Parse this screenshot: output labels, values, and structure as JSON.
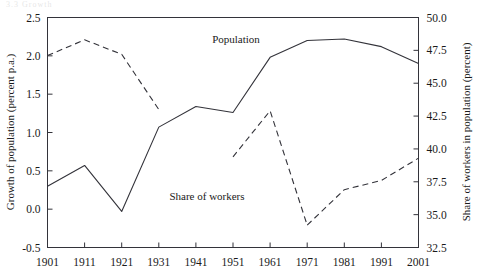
{
  "figure": {
    "ghost_text": "3.3  Growth",
    "background": "#ffffff",
    "line_color": "#33333a"
  },
  "chart_data": {
    "type": "line",
    "title": "",
    "xlabel": "",
    "ylabel": "Growth of population (percent p.a.)",
    "y2label": "Share of workers in population (percent)",
    "x": [
      1901,
      1911,
      1921,
      1931,
      1941,
      1951,
      1961,
      1971,
      1981,
      1991,
      2001
    ],
    "xticklabels": [
      "1901",
      "1911",
      "1921",
      "1931",
      "1941",
      "1951",
      "1961",
      "1971",
      "1981",
      "1991",
      "2001"
    ],
    "ylim": [
      -0.5,
      2.5
    ],
    "yticks": [
      -0.5,
      0.0,
      0.5,
      1.0,
      1.5,
      2.0,
      2.5
    ],
    "yticklabels": [
      "-0.5",
      "0.0",
      "0.5",
      "1.0",
      "1.5",
      "2.0",
      "2.5"
    ],
    "y2lim": [
      32.5,
      50.0
    ],
    "y2ticks": [
      32.5,
      35.0,
      37.5,
      40.0,
      42.5,
      45.0,
      47.5,
      50.0
    ],
    "y2ticklabels": [
      "32.5",
      "35.0",
      "37.5",
      "40.0",
      "42.5",
      "45.0",
      "47.5",
      "50.0"
    ],
    "grid": false,
    "legend_position": "inline-annotations",
    "series": [
      {
        "name": "Population",
        "axis": "left",
        "style": "solid",
        "x": [
          1901,
          1911,
          1921,
          1931,
          1941,
          1951,
          1961,
          1971,
          1981,
          1991,
          2001
        ],
        "values": [
          0.3,
          0.57,
          -0.03,
          1.07,
          1.34,
          1.26,
          1.98,
          2.2,
          2.22,
          2.12,
          1.9
        ],
        "annotation": "Population"
      },
      {
        "name": "Share of workers",
        "axis": "right",
        "style": "dashed",
        "annotation": "Share of workers",
        "segments": [
          {
            "x": [
              1901,
              1911,
              1921,
              1931
            ],
            "values": [
              47.1,
              48.3,
              47.2,
              43.0
            ]
          },
          {
            "x": [
              1951,
              1961,
              1971
            ],
            "values": [
              39.4,
              42.9,
              34.2
            ]
          },
          {
            "x": [
              1971,
              1981,
              1991,
              2001
            ],
            "values": [
              34.2,
              36.9,
              37.6,
              39.3
            ]
          }
        ]
      }
    ],
    "annotations": [
      {
        "text": "Population",
        "x_px": 236,
        "y_px": 43
      },
      {
        "text": "Share of workers",
        "x_px": 207,
        "y_px": 200
      }
    ]
  }
}
